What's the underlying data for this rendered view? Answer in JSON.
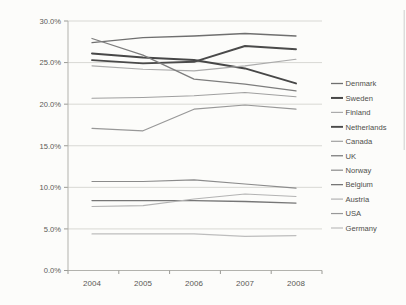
{
  "chart_data": {
    "type": "line",
    "title": "",
    "xlabel": "",
    "ylabel": "",
    "x": [
      "2004",
      "2005",
      "2006",
      "2007",
      "2008"
    ],
    "y_tick_labels": [
      "0.0%",
      "5.0%",
      "10.0%",
      "15.0%",
      "20.0%",
      "25.0%",
      "30.0%"
    ],
    "ylim": [
      0,
      30
    ],
    "y_tick_step": 5,
    "grid": "horizontal-only",
    "legend_position": "right",
    "series": [
      {
        "name": "Denmark",
        "values": [
          27.4,
          28.0,
          28.2,
          28.5,
          28.2
        ],
        "color": "#6f6f6f",
        "width": 1.3
      },
      {
        "name": "Sweden",
        "values": [
          26.1,
          25.6,
          25.3,
          24.3,
          22.5
        ],
        "color": "#474747",
        "width": 2.0
      },
      {
        "name": "Finland",
        "values": [
          24.6,
          24.2,
          24.0,
          24.6,
          25.4
        ],
        "color": "#ababab",
        "width": 1.1
      },
      {
        "name": "Netherlands",
        "values": [
          25.3,
          24.9,
          25.1,
          27.0,
          26.6
        ],
        "color": "#4a4a4a",
        "width": 1.9
      },
      {
        "name": "Canada",
        "values": [
          20.7,
          20.8,
          21.0,
          21.4,
          20.9
        ],
        "color": "#a0a0a0",
        "width": 1.1
      },
      {
        "name": "UK",
        "values": [
          27.9,
          25.9,
          23.0,
          22.4,
          21.6
        ],
        "color": "#7d7d7d",
        "width": 1.3
      },
      {
        "name": "Norway",
        "values": [
          10.7,
          10.7,
          10.9,
          10.4,
          9.9
        ],
        "color": "#8b8b8b",
        "width": 1.2
      },
      {
        "name": "Belgium",
        "values": [
          8.4,
          8.4,
          8.4,
          8.3,
          8.1
        ],
        "color": "#767676",
        "width": 1.3
      },
      {
        "name": "Austria",
        "values": [
          7.7,
          7.8,
          8.6,
          9.2,
          8.9
        ],
        "color": "#b3b3b3",
        "width": 1.1
      },
      {
        "name": "USA",
        "values": [
          17.1,
          16.8,
          19.4,
          19.9,
          19.4
        ],
        "color": "#989898",
        "width": 1.2
      },
      {
        "name": "Germany",
        "values": [
          4.4,
          4.4,
          4.4,
          4.1,
          4.2
        ],
        "color": "#bdbdbd",
        "width": 1.1
      }
    ]
  },
  "colors": {
    "background": "#fcfcfa",
    "grid": "#d8d8d4",
    "axis": "#b2b2ad",
    "tick": "#9a9a95",
    "tick_text": "#5a5a55",
    "legend_text": "#4f4f4a",
    "scan_artifact": "#a8a8a8"
  }
}
